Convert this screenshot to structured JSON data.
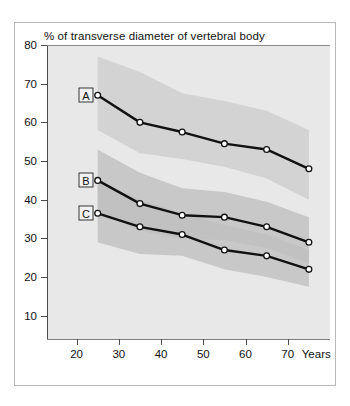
{
  "chart_data": {
    "type": "line",
    "title": "% of transverse diameter of vertebral body",
    "xlabel": "Years",
    "ylabel": "",
    "xlim": [
      13,
      80
    ],
    "ylim": [
      4,
      80
    ],
    "grid": false,
    "legend_position": "inline-boxed-labels",
    "xticks": [
      20,
      30,
      40,
      50,
      60,
      70
    ],
    "yticks": [
      10,
      20,
      30,
      40,
      50,
      60,
      70,
      80
    ],
    "x": [
      25,
      35,
      45,
      55,
      65,
      75
    ],
    "series": [
      {
        "name": "A",
        "label": "A",
        "values": [
          67,
          60,
          57.5,
          54.5,
          53,
          48
        ],
        "band_upper": [
          77,
          73,
          67.5,
          65.5,
          63,
          58
        ],
        "band_lower": [
          58,
          52,
          50.5,
          48.5,
          45.5,
          40
        ]
      },
      {
        "name": "B",
        "label": "B",
        "values": [
          45,
          39,
          36,
          35.5,
          33,
          29
        ],
        "band_upper": [
          53,
          47,
          43,
          42,
          39.5,
          35.5
        ],
        "band_lower": [
          37,
          32,
          30,
          29.5,
          27.5,
          23.5
        ]
      },
      {
        "name": "C",
        "label": "C",
        "values": [
          36.5,
          33,
          31,
          27,
          25.5,
          22
        ],
        "band_upper": [
          45,
          40,
          36.5,
          33.5,
          31,
          27
        ],
        "band_lower": [
          29,
          26,
          25.5,
          22,
          20,
          17.5
        ]
      }
    ],
    "annotations": [
      {
        "text": "A",
        "x": 22.2,
        "y": 67
      },
      {
        "text": "B",
        "x": 22.2,
        "y": 45
      },
      {
        "text": "C",
        "x": 22.2,
        "y": 36.5
      }
    ],
    "colors": {
      "line": "#111111",
      "marker_fill": "#ffffff",
      "marker_stroke": "#111111",
      "band_light": "#d2d2d2",
      "band_dark": "#bfbfbf",
      "plot_background": "#e8e8e8",
      "axis": "#4a4a4a",
      "page_background": "#ffffff"
    }
  },
  "axis": {
    "y_tick_labels": [
      "80",
      "70",
      "60",
      "50",
      "40",
      "30",
      "20",
      "10"
    ],
    "x_tick_labels": [
      "20",
      "30",
      "40",
      "50",
      "60",
      "70"
    ],
    "x_axis_title": "Years"
  }
}
